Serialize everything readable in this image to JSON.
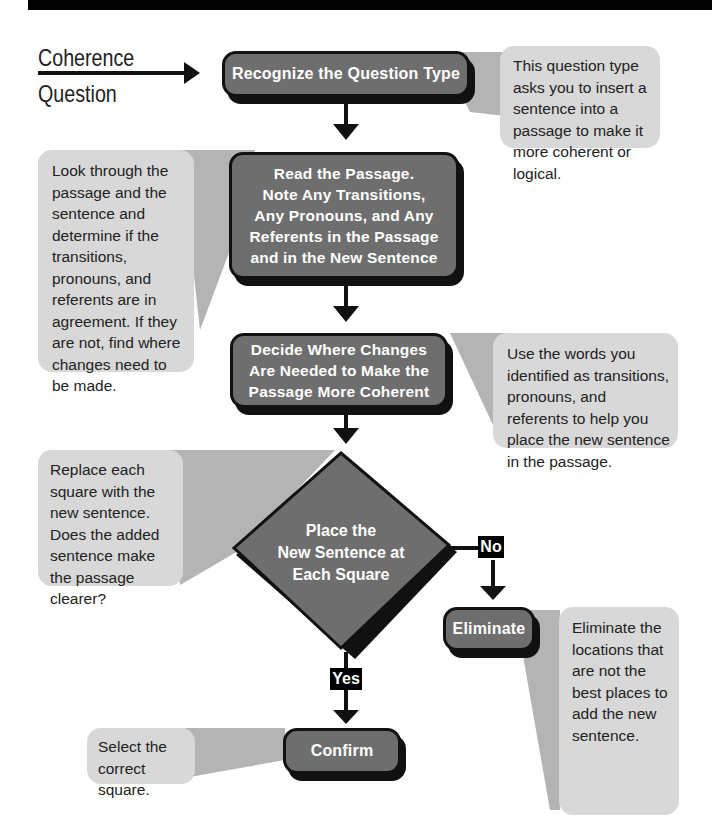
{
  "start": {
    "line1": "Coherence",
    "line2": "Question"
  },
  "steps": {
    "recognize": "Recognize the Question Type",
    "read": "Read the Passage.\nNote Any Transitions,\nAny Pronouns, and Any\nReferents in the Passage\nand in the New Sentence",
    "decide": "Decide Where Changes\nAre Needed to Make the\nPassage More Coherent",
    "place": "Place the\nNew Sentence at\nEach Square",
    "eliminate": "Eliminate",
    "confirm": "Confirm"
  },
  "branches": {
    "no": "No",
    "yes": "Yes"
  },
  "callouts": {
    "recognize": "This question type asks you to insert a sentence into a passage to make it more coherent or logical.",
    "read": "Look through the passage and the sentence and determine if the transitions, pronouns, and referents are in agreement. If they are not, find where changes need to be made.",
    "decide": "Use the words you identified as transitions, pronouns, and referents to help you place the new sentence in the passage.",
    "place": "Replace each square with the new sentence. Does the added sentence make the passage clearer?",
    "eliminate": "Eliminate the locations that are not the best places to add the new sentence.",
    "confirm": "Select the correct square."
  },
  "colors": {
    "box_fill": "#6e6e6e",
    "box_border": "#111111",
    "callout_fill": "#d8d8d8",
    "connector_fill": "#b4b4b4"
  }
}
